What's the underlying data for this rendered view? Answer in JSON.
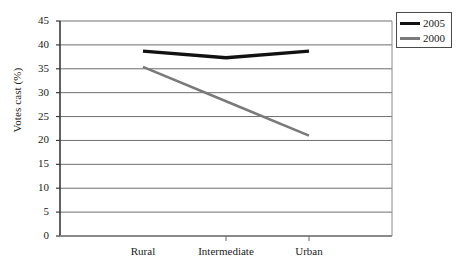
{
  "chart_data": {
    "type": "line",
    "title": "",
    "xlabel": "",
    "ylabel": "Votes cast (%)",
    "categories": [
      "Rural",
      "Intermediate",
      "Urban"
    ],
    "series": [
      {
        "name": "2005",
        "color": "#111111",
        "values": [
          38.7,
          37.3,
          38.7
        ]
      },
      {
        "name": "2000",
        "color": "#7a7a7a",
        "values": [
          35.4,
          28.2,
          21.0
        ]
      }
    ],
    "ylim": [
      0,
      45
    ],
    "ytick_step": 5,
    "yticks": [
      45,
      40,
      35,
      30,
      25,
      20,
      15,
      10,
      5,
      0
    ],
    "ytick_labels": [
      "45",
      "40",
      "35",
      "30",
      "25",
      "20",
      "15",
      "10",
      "5",
      "0"
    ],
    "grid": true,
    "grid_axis": "y",
    "legend_position": "top-right",
    "legend_entries": [
      "2005",
      "2000"
    ]
  },
  "axes": {
    "y_title": "Votes cast (%)"
  },
  "legend": {
    "items": [
      {
        "label": "2005"
      },
      {
        "label": "2000"
      }
    ]
  }
}
